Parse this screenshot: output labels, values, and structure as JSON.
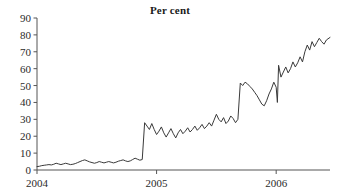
{
  "chart_data": {
    "type": "line",
    "title": "Per cent",
    "xlabel": "",
    "ylabel": "",
    "ylim": [
      0,
      90
    ],
    "yticks": [
      0,
      10,
      20,
      30,
      40,
      50,
      60,
      70,
      80,
      90
    ],
    "ytick_labels": [
      "0",
      "10",
      "20",
      "30",
      "40",
      "50",
      "60",
      "70",
      "80",
      "90"
    ],
    "xlim": [
      2004.0,
      2006.45
    ],
    "xticks": [
      2004,
      2005,
      2006
    ],
    "xtick_labels": [
      "2004",
      "2005",
      "2006"
    ],
    "grid": false,
    "legend": null,
    "line_color": "#3a3a3a",
    "axis_color": "#555555",
    "background": "#ffffff",
    "series": [
      {
        "name": "Per cent",
        "x": [
          2004.0,
          2004.02,
          2004.04,
          2004.06,
          2004.08,
          2004.1,
          2004.12,
          2004.14,
          2004.16,
          2004.18,
          2004.2,
          2004.22,
          2004.24,
          2004.26,
          2004.28,
          2004.3,
          2004.32,
          2004.34,
          2004.36,
          2004.38,
          2004.4,
          2004.42,
          2004.44,
          2004.46,
          2004.48,
          2004.5,
          2004.52,
          2004.54,
          2004.56,
          2004.58,
          2004.6,
          2004.62,
          2004.64,
          2004.66,
          2004.68,
          2004.7,
          2004.72,
          2004.74,
          2004.76,
          2004.78,
          2004.8,
          2004.82,
          2004.84,
          2004.86,
          2004.88,
          2004.9,
          2004.92,
          2004.94,
          2004.96,
          2004.98,
          2005.0,
          2005.02,
          2005.04,
          2005.06,
          2005.08,
          2005.1,
          2005.12,
          2005.14,
          2005.16,
          2005.18,
          2005.2,
          2005.22,
          2005.24,
          2005.26,
          2005.28,
          2005.3,
          2005.32,
          2005.34,
          2005.36,
          2005.38,
          2005.4,
          2005.42,
          2005.44,
          2005.46,
          2005.48,
          2005.5,
          2005.52,
          2005.54,
          2005.56,
          2005.58,
          2005.6,
          2005.62,
          2005.64,
          2005.66,
          2005.68,
          2005.7,
          2005.72,
          2005.74,
          2005.76,
          2005.78,
          2005.8,
          2005.82,
          2005.84,
          2005.86,
          2005.88,
          2005.9,
          2005.92,
          2005.94,
          2005.96,
          2005.98,
          2006.0,
          2006.01,
          2006.02,
          2006.04,
          2006.06,
          2006.08,
          2006.1,
          2006.12,
          2006.14,
          2006.16,
          2006.18,
          2006.2,
          2006.22,
          2006.24,
          2006.26,
          2006.28,
          2006.3,
          2006.32,
          2006.34,
          2006.36,
          2006.38,
          2006.4,
          2006.42,
          2006.45
        ],
        "y": [
          2.0,
          2.2,
          2.6,
          2.8,
          3.0,
          3.2,
          3.0,
          3.4,
          4.0,
          3.6,
          3.2,
          3.6,
          4.0,
          3.6,
          3.2,
          3.4,
          3.8,
          4.4,
          5.0,
          5.6,
          6.0,
          5.4,
          4.8,
          4.4,
          4.0,
          4.4,
          5.0,
          4.6,
          4.2,
          4.6,
          5.0,
          4.6,
          4.2,
          4.6,
          5.2,
          5.6,
          6.0,
          5.4,
          5.0,
          5.4,
          6.2,
          7.0,
          6.4,
          5.8,
          6.2,
          28.0,
          26.0,
          24.0,
          27.5,
          24.0,
          21.0,
          23.0,
          25.5,
          22.0,
          19.5,
          22.0,
          24.5,
          21.5,
          19.0,
          22.0,
          24.0,
          21.5,
          23.0,
          25.0,
          22.5,
          24.0,
          26.0,
          23.5,
          25.0,
          27.0,
          24.5,
          26.0,
          28.0,
          26.0,
          29.5,
          33.0,
          30.0,
          28.5,
          31.0,
          27.5,
          29.0,
          32.0,
          30.5,
          28.0,
          30.0,
          51.5,
          50.0,
          52.0,
          51.0,
          49.5,
          48.0,
          46.0,
          44.0,
          41.5,
          39.0,
          38.0,
          41.0,
          45.0,
          48.0,
          52.0,
          49.0,
          40.0,
          62.0,
          55.0,
          58.0,
          61.0,
          57.5,
          60.0,
          64.0,
          61.0,
          63.5,
          67.0,
          64.0,
          70.0,
          74.0,
          71.0,
          76.0,
          73.0,
          75.5,
          78.0,
          76.0,
          74.5,
          77.0,
          78.5
        ]
      }
    ]
  }
}
